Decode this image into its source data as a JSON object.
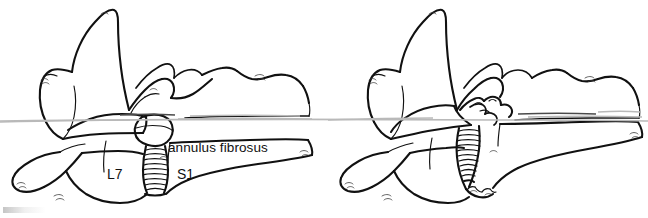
{
  "figure": {
    "background_color": "#ffffff",
    "ink_color": "#111111",
    "width": 648,
    "height": 218,
    "artifact_color": "#b9b9b9"
  },
  "panels": [
    {
      "id": "left-panel",
      "name": "normal-lumbosacral-junction",
      "caption": "",
      "labels": [
        {
          "id": "annulus",
          "text": "annulus fibrosus",
          "x": 168,
          "y": 141
        },
        {
          "id": "l7",
          "text": "L7",
          "x": 107,
          "y": 167
        },
        {
          "id": "s1",
          "text": "S1",
          "x": 177,
          "y": 167
        }
      ],
      "structures": [
        "L7 spinous process",
        "L7 vertebral body",
        "L7 transverse process",
        "intervertebral disc",
        "annulus fibrosus",
        "S1 sacrum",
        "articular facet"
      ]
    },
    {
      "id": "right-panel",
      "name": "degenerative-lumbosacral-junction",
      "caption": "",
      "labels": [],
      "structures": [
        "L7 spinous process",
        "L7 vertebral body",
        "L7 transverse process",
        "collapsed intervertebral disc",
        "protruded annulus fibrosus",
        "ventral spondylosis",
        "S1 sacrum"
      ]
    }
  ],
  "artifacts": {
    "scan_streak_label": "horizontal scan streak",
    "corner_smudge_label": "faint corner smudge"
  }
}
